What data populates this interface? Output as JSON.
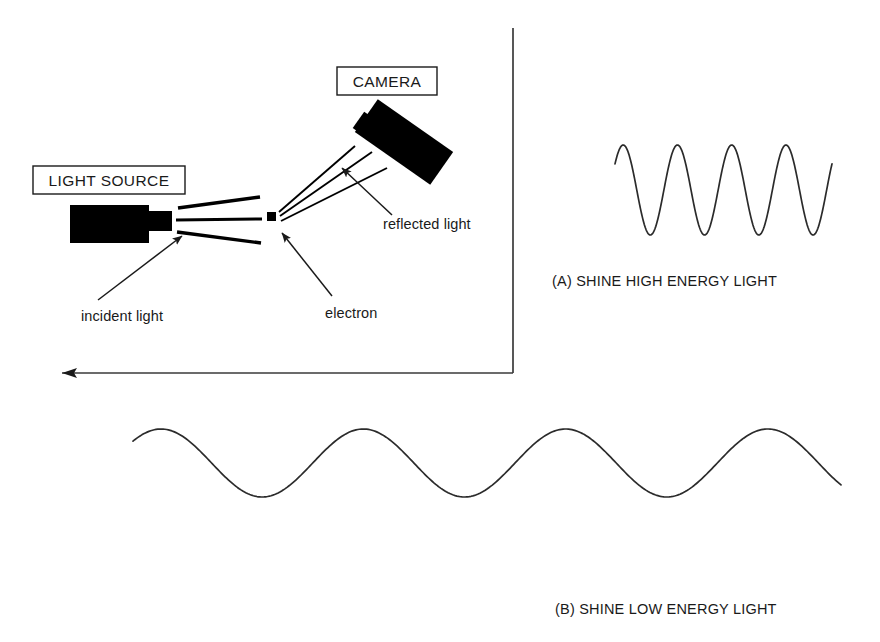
{
  "figure": {
    "background_color": "#ffffff",
    "ink_color": "#000000",
    "width": 880,
    "height": 642
  },
  "boxed_labels": {
    "light_source": "LIGHT SOURCE",
    "camera": "CAMERA"
  },
  "annotations": {
    "incident_light": "incident light",
    "reflected_light": "reflected light",
    "electron": "electron"
  },
  "captions": {
    "panel_a": "(A) SHINE HIGH ENERGY LIGHT",
    "panel_b": "(B) SHINE LOW ENERGY LIGHT"
  },
  "chart_data": {
    "type": "line",
    "series": [
      {
        "name": "(A) SHINE HIGH ENERGY LIGHT",
        "description": "short wavelength, high frequency wave",
        "cycles": 4,
        "x_start": 615,
        "x_end": 832,
        "wavelength_px": 54,
        "amplitude_px": 45,
        "center_y": 190,
        "peak_y": 145,
        "trough_y": 235
      },
      {
        "name": "(B) SHINE LOW ENERGY LIGHT",
        "description": "long wavelength, low frequency wave",
        "cycles": 3.5,
        "x_start": 133,
        "x_end": 841,
        "wavelength_px": 202,
        "amplitude_px": 34,
        "center_y": 463,
        "peak_y": 429,
        "trough_y": 497
      }
    ],
    "xlabel": "",
    "ylabel": "",
    "grid": false,
    "legend": "none"
  },
  "optics": {
    "incident_beam_count": 3,
    "reflected_beam_count": 3,
    "electron_position": {
      "x": 271,
      "y": 216
    },
    "light_source_position": {
      "x": 70,
      "y": 205
    },
    "camera_position": {
      "x": 360,
      "y": 105
    }
  },
  "icon_names": {
    "axis_arrow": "arrow-left-icon",
    "light_source": "light-source-icon",
    "camera": "camera-icon",
    "electron": "electron-dot-icon",
    "pointer": "arrow-pointer-icon"
  }
}
